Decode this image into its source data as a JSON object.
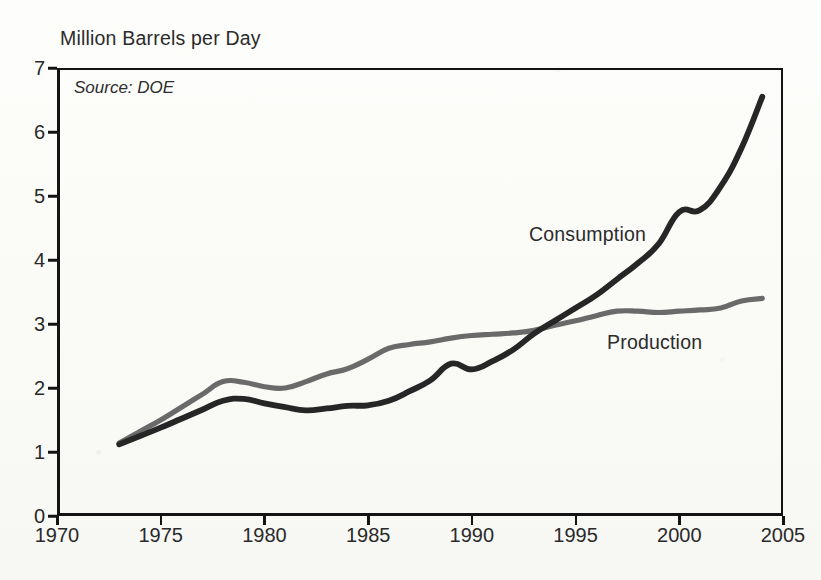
{
  "chart_data": {
    "type": "line",
    "title": "Million Barrels per Day",
    "source_note": "Source: DOE",
    "xlabel": "",
    "ylabel": "Million Barrels per Day",
    "xlim": [
      1970,
      2005
    ],
    "ylim": [
      0,
      7
    ],
    "grid": false,
    "legend_position": "inline-annotations",
    "x_tick_labels": [
      "1970",
      "1975",
      "1980",
      "1985",
      "1990",
      "1995",
      "2000",
      "2005"
    ],
    "x_ticks": [
      1970,
      1975,
      1980,
      1985,
      1990,
      1995,
      2000,
      2005
    ],
    "y_tick_labels": [
      "0",
      "1",
      "2",
      "3",
      "4",
      "5",
      "6",
      "7"
    ],
    "y_ticks": [
      0,
      1,
      2,
      3,
      4,
      5,
      6,
      7
    ],
    "x": [
      1973,
      1974,
      1975,
      1976,
      1977,
      1978,
      1979,
      1980,
      1981,
      1982,
      1983,
      1984,
      1985,
      1986,
      1987,
      1988,
      1989,
      1990,
      1991,
      1992,
      1993,
      1994,
      1995,
      1996,
      1997,
      1998,
      1999,
      2000,
      2001,
      2002,
      2003,
      2004
    ],
    "series": [
      {
        "name": "Consumption",
        "color": "#262626",
        "values": [
          1.12,
          1.25,
          1.38,
          1.52,
          1.66,
          1.8,
          1.83,
          1.76,
          1.7,
          1.65,
          1.68,
          1.72,
          1.73,
          1.8,
          1.95,
          2.12,
          2.38,
          2.29,
          2.42,
          2.6,
          2.85,
          3.05,
          3.25,
          3.45,
          3.7,
          3.95,
          4.25,
          4.75,
          4.78,
          5.15,
          5.75,
          6.55
        ]
      },
      {
        "name": "Production",
        "color": "#6a6a6a",
        "values": [
          1.14,
          1.32,
          1.5,
          1.7,
          1.9,
          2.1,
          2.09,
          2.02,
          2.0,
          2.1,
          2.22,
          2.3,
          2.45,
          2.62,
          2.68,
          2.72,
          2.78,
          2.82,
          2.84,
          2.86,
          2.9,
          2.98,
          3.05,
          3.13,
          3.2,
          3.2,
          3.18,
          3.2,
          3.22,
          3.25,
          3.36,
          3.4
        ]
      }
    ],
    "annotations": [
      {
        "text": "Consumption",
        "series": "Consumption"
      },
      {
        "text": "Production",
        "series": "Production"
      }
    ]
  },
  "chart": {
    "title": "Million Barrels per Day",
    "source": "Source: DOE"
  },
  "labels": {
    "consumption": "Consumption",
    "production": "Production"
  },
  "axes": {
    "y": {
      "ticks": [
        "7",
        "6",
        "5",
        "4",
        "3",
        "2",
        "1",
        "0"
      ]
    },
    "x": {
      "ticks": [
        "1970",
        "1975",
        "1980",
        "1985",
        "1990",
        "1995",
        "2000",
        "2005"
      ]
    }
  },
  "colors": {
    "consumption_line": "#262626",
    "production_line": "#6a6a6a",
    "axis": "#141414",
    "text": "#2a2a2a",
    "background": "#fbfbf9"
  }
}
